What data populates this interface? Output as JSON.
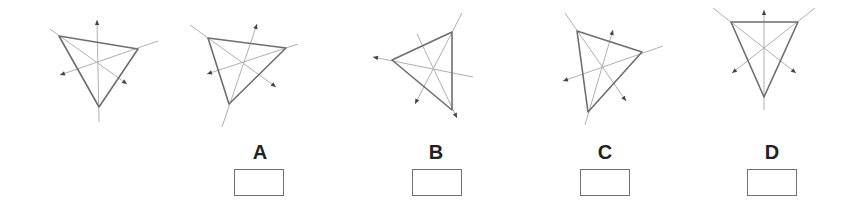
{
  "colors": {
    "triangle_stroke": "#6e6e6e",
    "axis_stroke": "#b0b0b0",
    "arrow_fill": "#444444",
    "label_text": "#222222",
    "box_border": "#707070"
  },
  "figures": [
    {
      "id": "reference",
      "label": "",
      "triangle": [
        [
          59,
          36
        ],
        [
          138,
          49
        ],
        [
          99,
          107
        ]
      ],
      "axes": [
        {
          "arrow": [
            97,
            20
          ],
          "end": [
            99,
            122
          ]
        },
        {
          "arrow": [
            60,
            75
          ],
          "end": [
            158,
            41
          ]
        },
        {
          "arrow": [
            127,
            84
          ],
          "end": [
            50,
            29
          ]
        }
      ]
    },
    {
      "id": "A",
      "label": "A",
      "triangle": [
        [
          208,
          38
        ],
        [
          286,
          48
        ],
        [
          229,
          104
        ]
      ],
      "axes": [
        {
          "arrow": [
            257,
            24
          ],
          "end": [
            222,
            127
          ]
        },
        {
          "arrow": [
            207,
            74
          ],
          "end": [
            298,
            44
          ]
        },
        {
          "arrow": [
            276,
            87
          ],
          "end": [
            190,
            25
          ]
        }
      ]
    },
    {
      "id": "B",
      "label": "B",
      "triangle": [
        [
          392,
          60
        ],
        [
          452,
          32
        ],
        [
          452,
          110
        ]
      ],
      "axes": [
        {
          "arrow": [
            373,
            57
          ],
          "end": [
            473,
            77
          ]
        },
        {
          "arrow": [
            415,
            104
          ],
          "end": [
            462,
            13
          ]
        },
        {
          "arrow": [
            457,
            118
          ],
          "end": [
            417,
            34
          ]
        }
      ]
    },
    {
      "id": "C",
      "label": "C",
      "triangle": [
        [
          577,
          31
        ],
        [
          642,
          52
        ],
        [
          588,
          112
        ]
      ],
      "axes": [
        {
          "arrow": [
            613,
            30
          ],
          "end": [
            585,
            125
          ]
        },
        {
          "arrow": [
            563,
            81
          ],
          "end": [
            663,
            46
          ]
        },
        {
          "arrow": [
            626,
            101
          ],
          "end": [
            565,
            13
          ]
        }
      ]
    },
    {
      "id": "D",
      "label": "D",
      "triangle": [
        [
          731,
          22
        ],
        [
          798,
          22
        ],
        [
          764,
          97
        ]
      ],
      "axes": [
        {
          "arrow": [
            764,
            10
          ],
          "end": [
            764,
            110
          ]
        },
        {
          "arrow": [
            732,
            73
          ],
          "end": [
            815,
            8
          ]
        },
        {
          "arrow": [
            796,
            73
          ],
          "end": [
            713,
            8
          ]
        }
      ]
    }
  ],
  "options": [
    {
      "label": "A",
      "label_x": 260,
      "box_x": 234,
      "value": ""
    },
    {
      "label": "B",
      "label_x": 436,
      "box_x": 412,
      "value": ""
    },
    {
      "label": "C",
      "label_x": 605,
      "box_x": 580,
      "value": ""
    },
    {
      "label": "D",
      "label_x": 772,
      "box_x": 747,
      "value": ""
    }
  ]
}
